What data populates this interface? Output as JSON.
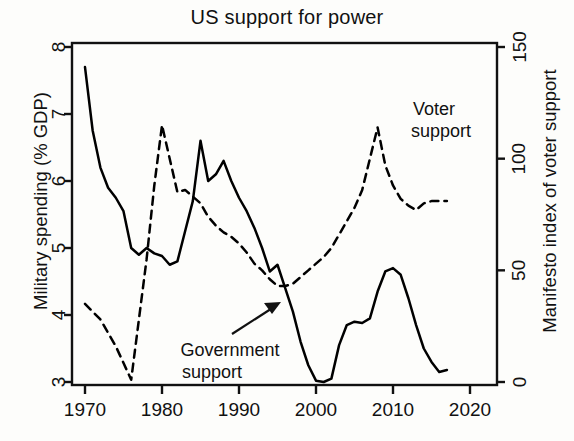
{
  "chart_data": {
    "type": "line",
    "title": "US support for power",
    "xlabel": "",
    "ylabel": "Military spending (% GDP)",
    "y2label": "Manifesto index of voter support",
    "xlim": [
      1968,
      2022
    ],
    "ylim": [
      3,
      8
    ],
    "y2lim": [
      0,
      150
    ],
    "grid": false,
    "legend": "inline-annotations",
    "xticks": [
      1970,
      1980,
      1990,
      2000,
      2010,
      2020
    ],
    "yticks": [
      3,
      4,
      5,
      6,
      7,
      8
    ],
    "y2ticks": [
      0,
      50,
      100,
      150
    ],
    "annotations": [
      {
        "text_line1": "Voter",
        "text_line2": "support",
        "target_series": "Voter support",
        "x": 2007,
        "y2": 118
      },
      {
        "text_line1": "Government",
        "text_line2": "support",
        "target_series": "Government support",
        "x": 1993,
        "y": 4.0,
        "arrow": true
      }
    ],
    "series": [
      {
        "name": "Government support",
        "axis": "left",
        "style": "solid",
        "color": "#000000",
        "units": "% GDP",
        "points": [
          [
            1970,
            7.7
          ],
          [
            1971,
            6.75
          ],
          [
            1972,
            6.2
          ],
          [
            1973,
            5.9
          ],
          [
            1974,
            5.75
          ],
          [
            1975,
            5.55
          ],
          [
            1976,
            5.0
          ],
          [
            1977,
            4.9
          ],
          [
            1978,
            5.0
          ],
          [
            1979,
            4.92
          ],
          [
            1980,
            4.88
          ],
          [
            1981,
            4.75
          ],
          [
            1982,
            4.8
          ],
          [
            1983,
            5.25
          ],
          [
            1984,
            5.7
          ],
          [
            1985,
            6.6
          ],
          [
            1986,
            6.0
          ],
          [
            1987,
            6.1
          ],
          [
            1988,
            6.3
          ],
          [
            1989,
            6.0
          ],
          [
            1990,
            5.75
          ],
          [
            1991,
            5.55
          ],
          [
            1992,
            5.3
          ],
          [
            1993,
            5.0
          ],
          [
            1994,
            4.65
          ],
          [
            1995,
            4.75
          ],
          [
            1996,
            4.4
          ],
          [
            1997,
            4.05
          ],
          [
            1998,
            3.6
          ],
          [
            1999,
            3.25
          ],
          [
            2000,
            3.02
          ],
          [
            2001,
            3.0
          ],
          [
            2002,
            3.05
          ],
          [
            2003,
            3.55
          ],
          [
            2004,
            3.85
          ],
          [
            2005,
            3.9
          ],
          [
            2006,
            3.88
          ],
          [
            2007,
            3.95
          ],
          [
            2008,
            4.35
          ],
          [
            2009,
            4.65
          ],
          [
            2010,
            4.7
          ],
          [
            2011,
            4.6
          ],
          [
            2012,
            4.25
          ],
          [
            2013,
            3.85
          ],
          [
            2014,
            3.5
          ],
          [
            2015,
            3.3
          ],
          [
            2016,
            3.15
          ],
          [
            2017,
            3.18
          ]
        ]
      },
      {
        "name": "Voter support",
        "axis": "right",
        "style": "dashed",
        "color": "#000000",
        "units": "Manifesto index",
        "points": [
          [
            1970,
            35
          ],
          [
            1972,
            28
          ],
          [
            1974,
            16
          ],
          [
            1976,
            1
          ],
          [
            1978,
            55
          ],
          [
            1979,
            88
          ],
          [
            1980,
            115
          ],
          [
            1981,
            100
          ],
          [
            1982,
            85
          ],
          [
            1983,
            86
          ],
          [
            1984,
            83
          ],
          [
            1985,
            80
          ],
          [
            1986,
            74
          ],
          [
            1987,
            70
          ],
          [
            1988,
            67
          ],
          [
            1989,
            65
          ],
          [
            1990,
            62
          ],
          [
            1991,
            58
          ],
          [
            1992,
            53
          ],
          [
            1993,
            50
          ],
          [
            1994,
            46
          ],
          [
            1995,
            43
          ],
          [
            1996,
            43
          ],
          [
            1997,
            44
          ],
          [
            1998,
            47
          ],
          [
            1999,
            50
          ],
          [
            2000,
            53
          ],
          [
            2001,
            56
          ],
          [
            2002,
            60
          ],
          [
            2003,
            66
          ],
          [
            2004,
            72
          ],
          [
            2005,
            78
          ],
          [
            2006,
            86
          ],
          [
            2007,
            100
          ],
          [
            2008,
            114
          ],
          [
            2009,
            97
          ],
          [
            2010,
            88
          ],
          [
            2011,
            82
          ],
          [
            2012,
            79
          ],
          [
            2013,
            77
          ],
          [
            2014,
            80
          ],
          [
            2015,
            81
          ],
          [
            2016,
            81
          ],
          [
            2017,
            81
          ]
        ]
      }
    ]
  }
}
